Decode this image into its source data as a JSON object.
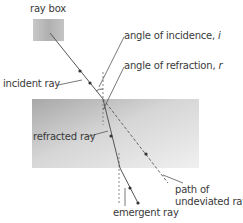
{
  "diagram": {
    "labels": {
      "ray_box": "ray box",
      "incident_ray": "incident ray",
      "angle_of_incidence": "angle of incidence,",
      "angle_of_incidence_symbol": "i",
      "angle_of_refraction": "angle of refraction,",
      "angle_of_refraction_symbol": "r",
      "refracted_ray": "refracted ray",
      "path_of_undeviated_ray_line1": "path of",
      "path_of_undeviated_ray_line2": "undeviated ray",
      "emergent_ray": "emergent ray"
    },
    "colors": {
      "ray_box_fill": "#b8b8b8",
      "glass_block_light": "#e6e6e6",
      "glass_block_dark": "#9a9a9a",
      "ray": "#555555",
      "normal_dashed": "#888888",
      "text": "#3a3a3a"
    }
  }
}
